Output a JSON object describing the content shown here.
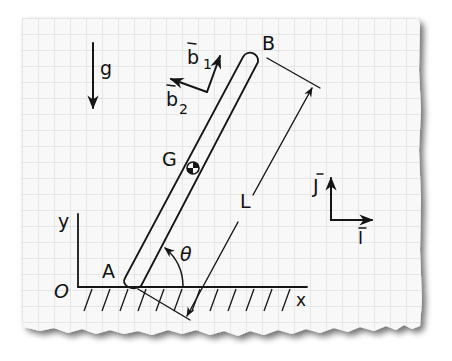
{
  "diagram": {
    "type": "mechanics-free-body-sketch",
    "background": "graph-paper",
    "colors": {
      "paper": "#f7f7f7",
      "grid": "#d6d6d6",
      "ink": "#151515",
      "shadow": "#9a9a9a"
    },
    "labels": {
      "gravity": "g",
      "b1": "b",
      "b1_sub": "1",
      "b2": "b",
      "b2_sub": "2",
      "point_b": "B",
      "point_a": "A",
      "center_of_mass": "G",
      "length": "L",
      "angle": "θ",
      "origin": "O",
      "x_axis": "x",
      "y_axis": "y",
      "unit_j": "J",
      "unit_i": "I"
    }
  }
}
